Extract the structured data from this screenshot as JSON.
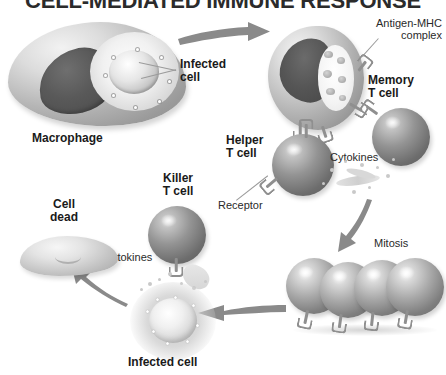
{
  "title": "CELL-MEDIATED IMMUNE RESPONSE",
  "labels": {
    "macrophage": "Macrophage",
    "infected_cell_top": "Infected\ncell",
    "antigen_mhc": "Antigen-MHC\ncomplex",
    "memory_t_cell": "Memory\nT cell",
    "helper_t_cell": "Helper\nT cell",
    "cytokines_right": "Cytokines",
    "receptor": "Receptor",
    "mitosis": "Mitosis",
    "killer_t_cell": "Killer\nT cell",
    "cytokines_left": "Cytokines",
    "cell_dead": "Cell\ndead",
    "infected_cell_bottom": "Infected cell"
  },
  "colors": {
    "title": "#2b2b2b",
    "label": "#1a1a1a",
    "arrow": "#8a8a8a",
    "leader": "#9a9a9a",
    "background": "#ffffff"
  },
  "diagram": {
    "type": "biology-process-flow",
    "steps": [
      "Macrophage engulfs infected cell",
      "Macrophage presents Antigen-MHC complex",
      "Helper T cell binds via Receptor",
      "Memory T cell forms",
      "Cytokines released",
      "Mitosis produces clone of T cells",
      "Killer T cell attacks Infected cell",
      "Cell dead"
    ],
    "clone_cell_count": 4
  }
}
